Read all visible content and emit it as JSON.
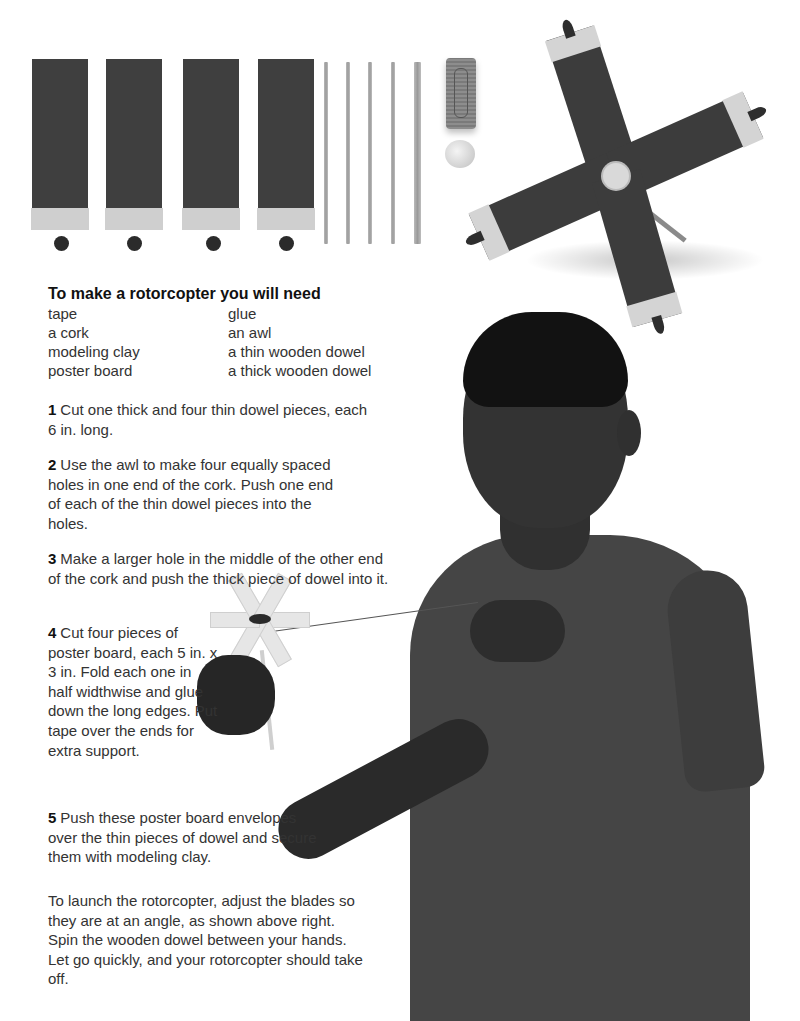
{
  "page": {
    "materials_photo": {
      "cards": [
        {
          "label": "poster-board-envelope-1"
        },
        {
          "label": "poster-board-envelope-2"
        },
        {
          "label": "poster-board-envelope-3"
        },
        {
          "label": "poster-board-envelope-4"
        }
      ],
      "clay_balls": 4,
      "thin_dowels": 4,
      "thick_dowels": 1,
      "cork": "cork",
      "bead": "cork-end-disc"
    },
    "rotorcopter_photo": {
      "blades": 4,
      "caption_hint": "assembled rotorcopter with blades at an angle"
    },
    "needs": {
      "title": "To make a rotorcopter you will need",
      "col1": [
        "tape",
        "a cork",
        "modeling clay",
        "poster board"
      ],
      "col2": [
        "glue",
        "an awl",
        "a thin wooden dowel",
        "a thick wooden dowel"
      ]
    },
    "steps": [
      {
        "num": "1",
        "text": "Cut one thick and four thin dowel pieces, each 6 in. long."
      },
      {
        "num": "2",
        "text": "Use the awl to make four equally spaced holes in one end of the cork. Push one end of each of the thin dowel pieces into the holes."
      },
      {
        "num": "3",
        "text": "Make a larger hole in the middle of the other end of the cork and push the thick piece of dowel into it."
      },
      {
        "num": "4",
        "text": "Cut four pieces of poster board, each 5 in. x 3 in. Fold each one in half widthwise and glue down the long edges. Put tape over the ends for extra support."
      },
      {
        "num": "5",
        "text": "Push these poster board envelopes over the thin pieces of dowel and secure them with modeling clay."
      }
    ],
    "launch": "To launch the rotorcopter, adjust the blades so they are at an angle, as shown above right. Spin the wooden dowel between your hands. Let go quickly, and your rotorcopter should take off.",
    "colors": {
      "background": "#ffffff",
      "text": "#333333",
      "heading": "#111111",
      "poster_board": "#3f3f3f",
      "tape": "#cfcfcf"
    }
  }
}
